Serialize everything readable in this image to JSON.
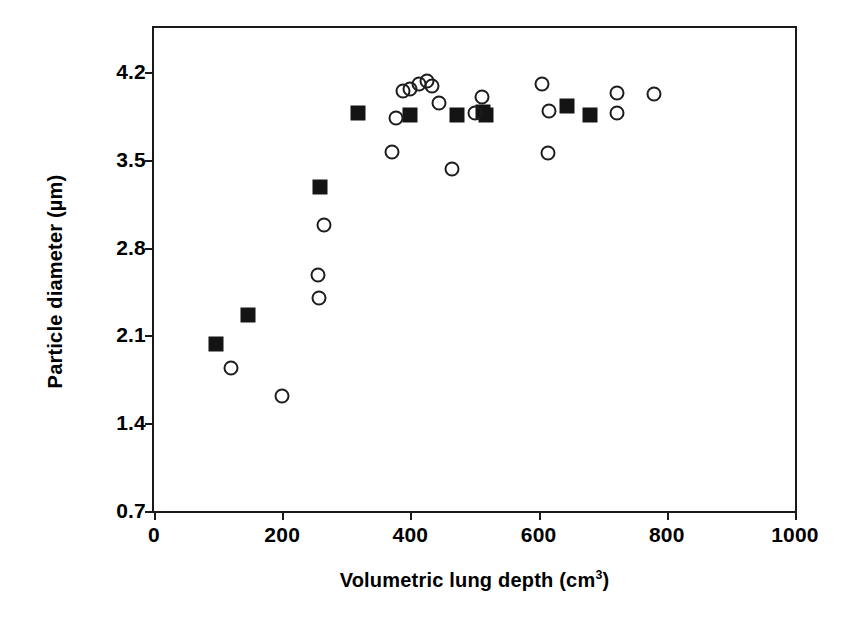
{
  "chart_data": {
    "type": "scatter",
    "title": "",
    "xlabel": "Volumetric lung depth (cm³)",
    "xlabel_text": "Volumetric lung depth (cm",
    "xlabel_sup": "3",
    "xlabel_tail": ")",
    "ylabel": "Particle diameter (µm)",
    "xlim": [
      0,
      1000
    ],
    "ylim": [
      0.7,
      4.55
    ],
    "xticks": [
      0,
      200,
      400,
      600,
      800,
      1000
    ],
    "xtick_labels": [
      "0",
      "200",
      "400",
      "600",
      "800",
      "1000"
    ],
    "yticks": [
      0.7,
      1.4,
      2.1,
      2.8,
      3.5,
      4.2
    ],
    "ytick_labels": [
      "0.7",
      "1.4",
      "2.1",
      "2.8",
      "3.5",
      "4.2"
    ],
    "grid": false,
    "legend": "none",
    "marker_color": "#1a1a1a",
    "series": [
      {
        "name": "filled-square",
        "marker": "square-filled",
        "points": [
          [
            96,
            2.03
          ],
          [
            146,
            2.26
          ],
          [
            259,
            3.28
          ],
          [
            318,
            3.87
          ],
          [
            400,
            3.86
          ],
          [
            473,
            3.86
          ],
          [
            513,
            3.88
          ],
          [
            518,
            3.86
          ],
          [
            645,
            3.93
          ],
          [
            680,
            3.86
          ]
        ]
      },
      {
        "name": "open-circle",
        "marker": "circle-open",
        "points": [
          [
            120,
            1.84
          ],
          [
            199,
            1.62
          ],
          [
            256,
            2.58
          ],
          [
            258,
            2.4
          ],
          [
            265,
            2.98
          ],
          [
            372,
            3.56
          ],
          [
            377,
            3.83
          ],
          [
            389,
            4.05
          ],
          [
            399,
            4.06
          ],
          [
            414,
            4.1
          ],
          [
            426,
            4.13
          ],
          [
            433,
            4.09
          ],
          [
            444,
            3.95
          ],
          [
            465,
            3.43
          ],
          [
            500,
            3.87
          ],
          [
            512,
            4.0
          ],
          [
            605,
            4.1
          ],
          [
            617,
            3.89
          ],
          [
            614,
            3.55
          ],
          [
            723,
            4.03
          ],
          [
            723,
            3.87
          ],
          [
            780,
            4.02
          ]
        ]
      }
    ]
  },
  "axis": {
    "frame_color": "#1a1a1a"
  }
}
